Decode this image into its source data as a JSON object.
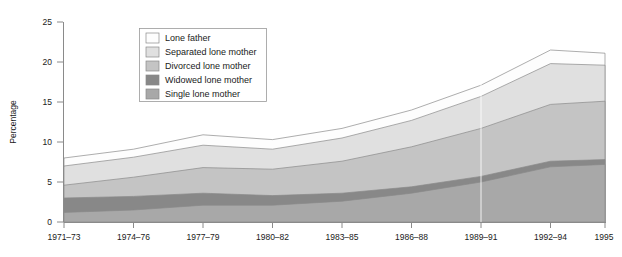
{
  "chart_data": {
    "type": "area",
    "stacked": true,
    "title": "",
    "subtitle": "",
    "xlabel": "",
    "ylabel": "Percentage",
    "ylim": [
      0,
      25
    ],
    "ytick_labels": [
      "0",
      "5",
      "10",
      "15",
      "20",
      "25"
    ],
    "ytick_values": [
      0,
      5,
      10,
      15,
      20,
      25
    ],
    "grid": false,
    "legend_position": "top-left-inside",
    "categories": [
      "1971–73",
      "1974–76",
      "1977–79",
      "1980–82",
      "1983–85",
      "1986–88",
      "1989–91",
      "1992–94",
      "1995"
    ],
    "series": [
      {
        "name": "Single lone mother",
        "color": "#a8a8a8",
        "values": [
          1.2,
          1.5,
          2.1,
          2.1,
          2.6,
          3.6,
          5.0,
          6.9,
          7.2
        ]
      },
      {
        "name": "Widowed lone mother",
        "color": "#888888",
        "values": [
          1.8,
          1.7,
          1.5,
          1.2,
          1.0,
          0.8,
          0.7,
          0.7,
          0.6
        ]
      },
      {
        "name": "Divorced lone mother",
        "color": "#c4c4c4",
        "values": [
          1.6,
          2.4,
          3.2,
          3.3,
          4.0,
          5.0,
          6.0,
          7.1,
          7.3
        ]
      },
      {
        "name": "Separated lone mother",
        "color": "#e0e0e0",
        "values": [
          2.4,
          2.5,
          2.8,
          2.5,
          2.9,
          3.3,
          4.0,
          5.1,
          4.5
        ]
      },
      {
        "name": "Lone father",
        "color": "#fdfdfd",
        "values": [
          1.0,
          1.0,
          1.3,
          1.2,
          1.2,
          1.3,
          1.4,
          1.7,
          1.5
        ]
      }
    ],
    "totals": [
      8.0,
      9.1,
      10.9,
      10.3,
      11.7,
      14.0,
      17.1,
      21.5,
      21.1
    ]
  },
  "legend": {
    "entries": [
      {
        "label": "Lone father",
        "color": "#fdfdfd"
      },
      {
        "label": "Separated lone mother",
        "color": "#e0e0e0"
      },
      {
        "label": "Divorced lone mother",
        "color": "#c4c4c4"
      },
      {
        "label": "Widowed lone mother",
        "color": "#888888"
      },
      {
        "label": "Single lone mother",
        "color": "#a8a8a8"
      }
    ]
  },
  "axes": {
    "y_title": "Percentage",
    "y_ticks": [
      "25",
      "20",
      "15",
      "10",
      "5",
      "0"
    ],
    "x_ticks": [
      "1971–73",
      "1974–76",
      "1977–79",
      "1980–82",
      "1983–85",
      "1986–88",
      "1989–91",
      "1992–94",
      "1995"
    ]
  }
}
